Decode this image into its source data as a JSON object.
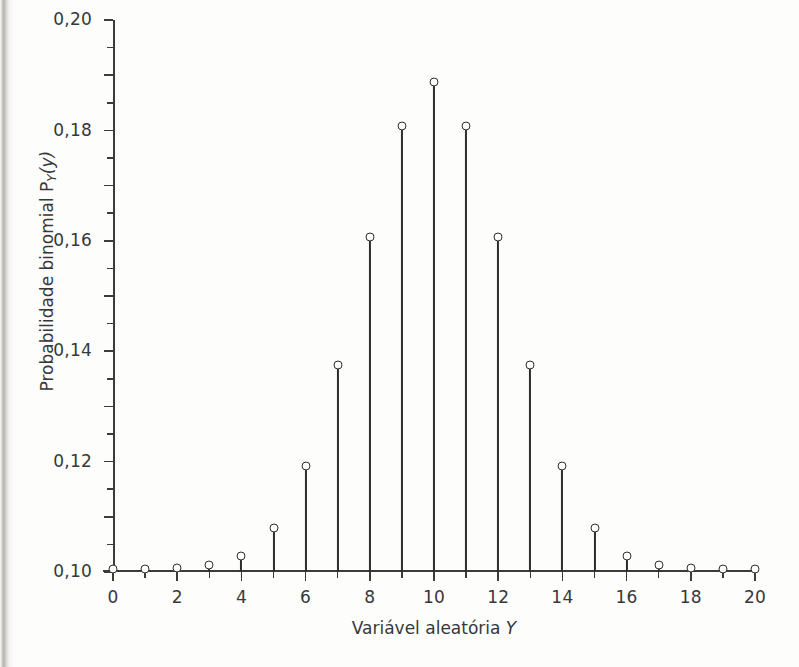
{
  "chart_data": {
    "type": "bar",
    "plot_style": "stem",
    "title": "",
    "xlabel": "Variável aleatória Y",
    "ylabel": "Probabilidade binomial P_Y(y)",
    "ylabel_parts": {
      "text": "Probabilidade binomial P",
      "subscript": "Y",
      "argument": "(y)"
    },
    "xlabel_parts": {
      "text": "Variável aleatória",
      "variable": "Y"
    },
    "decimal_separator": ",",
    "grid": false,
    "legend": null,
    "xlim": [
      0,
      20
    ],
    "ylim": [
      0.0,
      0.2
    ],
    "x_major_step": 2,
    "x_minor_step": 1,
    "y_major_step": 0.02,
    "y_minor_step": 0.01,
    "categories": [
      0,
      1,
      2,
      3,
      4,
      5,
      6,
      7,
      8,
      9,
      10,
      11,
      12,
      13,
      14,
      15,
      16,
      17,
      18,
      19,
      20
    ],
    "values": [
      0.0,
      0.0,
      0.0002,
      0.0011,
      0.0046,
      0.0148,
      0.037,
      0.0739,
      0.1201,
      0.1602,
      0.1762,
      0.1602,
      0.1201,
      0.0739,
      0.037,
      0.0148,
      0.0046,
      0.0011,
      0.0002,
      0.0,
      0.0
    ],
    "xtick_labels": [
      "0",
      "2",
      "4",
      "6",
      "8",
      "10",
      "12",
      "14",
      "16",
      "18",
      "20"
    ],
    "xtick_values": [
      0,
      2,
      4,
      6,
      8,
      10,
      12,
      14,
      16,
      18,
      20
    ],
    "ytick_labels": [
      "0,00",
      "0,02",
      "0,04",
      "0,06",
      "0,08",
      "0,10",
      "0,12",
      "0,14",
      "0,16",
      "0,18",
      "0,20"
    ],
    "ytick_values": [
      0.0,
      0.02,
      0.04,
      0.06,
      0.08,
      0.1,
      0.12,
      0.14,
      0.16,
      0.18,
      0.2
    ],
    "distribution": "Binomial(n=20, p=0,5)",
    "marker_style": "open-circle",
    "colors": {
      "stem": "#2e2e2e",
      "marker_edge": "#2e2e2e",
      "marker_fill": "#fdfdfc",
      "axis": "#3b3b3b",
      "text": "#37373a",
      "background": "#fdfdfc"
    }
  }
}
